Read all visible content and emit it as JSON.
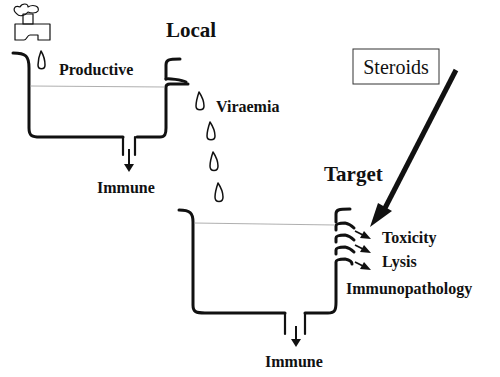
{
  "diagram": {
    "type": "flow-reservoir",
    "colors": {
      "ink": "#111111",
      "background": "#ffffff",
      "waterline": "#9a9a9a"
    },
    "labels": {
      "local": "Local",
      "productive": "Productive",
      "viraemia": "Viraemia",
      "immune_top": "Immune",
      "target": "Target",
      "steroids": "Steroids",
      "toxicity": "Toxicity",
      "lysis": "Lysis",
      "immunopathology": "Immunopathology",
      "immune_bottom": "Immune"
    },
    "icons": [
      "tap-icon",
      "droplet-icon",
      "overflow-spout-icon",
      "drain-arrow-icon",
      "steroids-arrow-icon"
    ]
  }
}
